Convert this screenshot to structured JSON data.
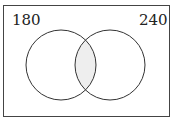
{
  "diagram": {
    "type": "venn",
    "left_label": "180",
    "right_label": "240",
    "colors": {
      "stroke": "#333333",
      "intersection_fill": "#eeeeee",
      "background": "#ffffff"
    }
  }
}
